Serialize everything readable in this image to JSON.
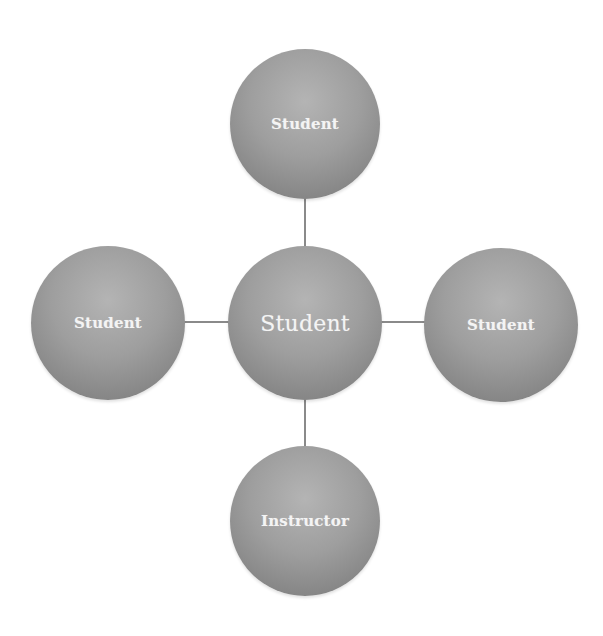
{
  "diagram": {
    "type": "hub-and-spoke",
    "colors": {
      "node_fill_light": "#b4b4b4",
      "node_fill_dark": "#7a7a7a",
      "node_text": "#f4f4f4",
      "connector": "#8a8a8a",
      "background": "#ffffff"
    },
    "center": {
      "label": "Student"
    },
    "spokes": {
      "top": {
        "label": "Student"
      },
      "left": {
        "label": "Student"
      },
      "right": {
        "label": "Student"
      },
      "bottom": {
        "label": "Instructor"
      }
    },
    "edges": [
      {
        "from": "center",
        "to": "top"
      },
      {
        "from": "center",
        "to": "left"
      },
      {
        "from": "center",
        "to": "right"
      },
      {
        "from": "center",
        "to": "bottom"
      }
    ]
  }
}
